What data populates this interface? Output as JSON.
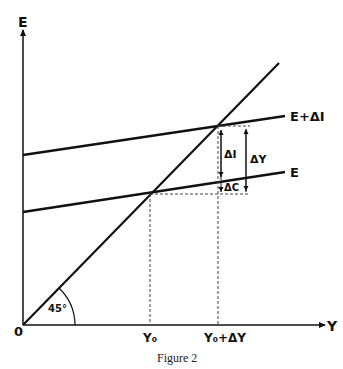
{
  "axes": {
    "y_label": "E",
    "x_label": "Y",
    "origin_label": "0",
    "angle_label": "45°"
  },
  "lines": {
    "upper_label": "E+ΔI",
    "lower_label": "E"
  },
  "ticks": {
    "y0": "Y₀",
    "y1": "Y₀+ΔY"
  },
  "annotations": {
    "delta_i": "ΔI",
    "delta_y": "ΔY",
    "delta_c": "ΔC"
  },
  "caption": "Figure 2"
}
